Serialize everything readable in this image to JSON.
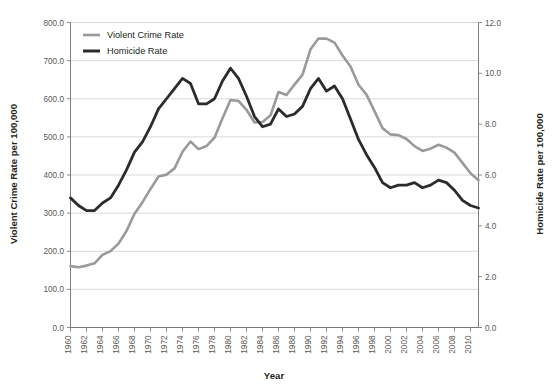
{
  "chart_data": {
    "type": "line",
    "title": "",
    "xlabel": "Year",
    "ylabel": "Violent Crime Rate per 100,000",
    "y2label": "Homicide Rate per 100,000",
    "grid": true,
    "legend_position": "top-left",
    "xlim": [
      1960,
      2011
    ],
    "ylim": [
      0,
      800
    ],
    "y2lim": [
      0,
      12
    ],
    "ytick_labels": [
      "0.0",
      "100.0",
      "200.0",
      "300.0",
      "400.0",
      "500.0",
      "600.0",
      "700.0",
      "800.0"
    ],
    "ytick_values": [
      0,
      100,
      200,
      300,
      400,
      500,
      600,
      700,
      800
    ],
    "y2tick_labels": [
      "0.0",
      "2.0",
      "4.0",
      "6.0",
      "8.0",
      "10.0",
      "12.0"
    ],
    "y2tick_values": [
      0,
      2,
      4,
      6,
      8,
      10,
      12
    ],
    "xtick_labels": [
      "1960",
      "1962",
      "1964",
      "1966",
      "1968",
      "1970",
      "1972",
      "1974",
      "1976",
      "1978",
      "1980",
      "1982",
      "1984",
      "1986",
      "1988",
      "1990",
      "1992",
      "1994",
      "1996",
      "1998",
      "2000",
      "2002",
      "2004",
      "2006",
      "2008",
      "2010"
    ],
    "xtick_values": [
      1960,
      1962,
      1964,
      1966,
      1968,
      1970,
      1972,
      1974,
      1976,
      1978,
      1980,
      1982,
      1984,
      1986,
      1988,
      1990,
      1992,
      1994,
      1996,
      1998,
      2000,
      2002,
      2004,
      2006,
      2008,
      2010
    ],
    "x": [
      1960,
      1961,
      1962,
      1963,
      1964,
      1965,
      1966,
      1967,
      1968,
      1969,
      1970,
      1971,
      1972,
      1973,
      1974,
      1975,
      1976,
      1977,
      1978,
      1979,
      1980,
      1981,
      1982,
      1983,
      1984,
      1985,
      1986,
      1987,
      1988,
      1989,
      1990,
      1991,
      1992,
      1993,
      1994,
      1995,
      1996,
      1997,
      1998,
      1999,
      2000,
      2001,
      2002,
      2003,
      2004,
      2005,
      2006,
      2007,
      2008,
      2009,
      2010,
      2011
    ],
    "series": [
      {
        "name": "Violent Crime Rate",
        "axis": "left",
        "color": "#9a9a9a",
        "width": 2.6,
        "values": [
          160.9,
          158.1,
          162.3,
          168.2,
          190.6,
          200.2,
          220.0,
          253.2,
          298.4,
          328.7,
          363.5,
          396.0,
          401.0,
          417.4,
          461.1,
          487.8,
          467.8,
          475.9,
          497.8,
          548.9,
          596.6,
          594.3,
          571.1,
          537.7,
          539.2,
          556.6,
          617.7,
          609.7,
          637.2,
          663.1,
          729.6,
          758.2,
          757.7,
          747.1,
          713.6,
          684.5,
          636.6,
          611.0,
          567.6,
          523.0,
          506.5,
          504.5,
          494.4,
          475.8,
          463.2,
          469.0,
          479.3,
          471.8,
          458.6,
          431.9,
          404.5,
          386.3
        ]
      },
      {
        "name": "Homicide Rate",
        "axis": "right",
        "color": "#2b2b2b",
        "width": 2.8,
        "values": [
          5.1,
          4.8,
          4.6,
          4.6,
          4.9,
          5.1,
          5.6,
          6.2,
          6.9,
          7.3,
          7.9,
          8.6,
          9.0,
          9.4,
          9.8,
          9.6,
          8.8,
          8.8,
          9.0,
          9.7,
          10.2,
          9.8,
          9.1,
          8.3,
          7.9,
          8.0,
          8.6,
          8.3,
          8.4,
          8.7,
          9.4,
          9.8,
          9.3,
          9.5,
          9.0,
          8.2,
          7.4,
          6.8,
          6.3,
          5.7,
          5.5,
          5.6,
          5.6,
          5.7,
          5.5,
          5.6,
          5.8,
          5.7,
          5.4,
          5.0,
          4.8,
          4.7
        ]
      }
    ]
  },
  "legend": {
    "items": [
      {
        "label": "Violent Crime Rate",
        "color": "#9a9a9a"
      },
      {
        "label": "Homicide Rate",
        "color": "#2b2b2b"
      }
    ]
  },
  "axes": {
    "left_title": "Violent Crime Rate per 100,000",
    "right_title": "Homicide Rate per 100,000",
    "x_title": "Year"
  }
}
